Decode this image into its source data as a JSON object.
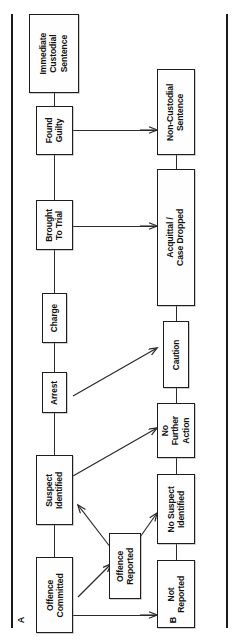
{
  "figure": {
    "type": "flowchart",
    "orientation": "rotated-90-ccw",
    "panels": [
      {
        "id": "A",
        "label": "A"
      },
      {
        "id": "B",
        "label": "B"
      }
    ]
  },
  "nodes": {
    "immediate_custodial_sentence": "Immediate\nCustodial\nSentence",
    "found_guilty": "Found\nGuilty",
    "brought_to_trial": "Brought\nTo Trial",
    "charge": "Charge",
    "arrest": "Arrest",
    "suspect_identified": "Suspect\nIdentified",
    "offence_committed": "Offence\nCommitted",
    "offence_reported": "Offence\nReported",
    "non_custodial_sentence": "Non-Custodial\nSentence",
    "acquittal_case_dropped": "Acquittal /\nCase Dropped",
    "caution": "Caution",
    "no_further_action": "No\nFurther\nAction",
    "no_suspect_identified": "No Suspect\nIdentified",
    "not_reported": "Not\nReported"
  },
  "edges": [
    {
      "from": "offence_committed",
      "to": "suspect_identified",
      "style": "plain"
    },
    {
      "from": "offence_committed",
      "to": "offence_reported",
      "style": "arrow"
    },
    {
      "from": "offence_committed",
      "to": "not_reported",
      "style": "arrow"
    },
    {
      "from": "offence_reported",
      "to": "suspect_identified",
      "style": "arrow"
    },
    {
      "from": "offence_reported",
      "to": "no_suspect_identified",
      "style": "arrow"
    },
    {
      "from": "suspect_identified",
      "to": "arrest",
      "style": "plain"
    },
    {
      "from": "suspect_identified",
      "to": "no_further_action",
      "style": "arrow"
    },
    {
      "from": "arrest",
      "to": "charge",
      "style": "plain"
    },
    {
      "from": "arrest",
      "to": "caution",
      "style": "arrow"
    },
    {
      "from": "charge",
      "to": "brought_to_trial",
      "style": "plain"
    },
    {
      "from": "brought_to_trial",
      "to": "found_guilty",
      "style": "plain"
    },
    {
      "from": "brought_to_trial",
      "to": "acquittal_case_dropped",
      "style": "arrow"
    },
    {
      "from": "found_guilty",
      "to": "immediate_custodial_sentence",
      "style": "plain"
    },
    {
      "from": "found_guilty",
      "to": "non_custodial_sentence",
      "style": "arrow"
    },
    {
      "from": "non_custodial_sentence",
      "to": "acquittal_case_dropped",
      "style": "plain"
    },
    {
      "from": "acquittal_case_dropped",
      "to": "caution",
      "style": "plain"
    },
    {
      "from": "caution",
      "to": "no_further_action",
      "style": "plain"
    },
    {
      "from": "no_further_action",
      "to": "no_suspect_identified",
      "style": "plain"
    },
    {
      "from": "no_suspect_identified",
      "to": "not_reported",
      "style": "plain"
    }
  ],
  "colors": {
    "ink": "#1d1d1d",
    "box_fill": "#fefefe",
    "rail": "#1a1a1a",
    "connector": "#2b2b2b"
  }
}
